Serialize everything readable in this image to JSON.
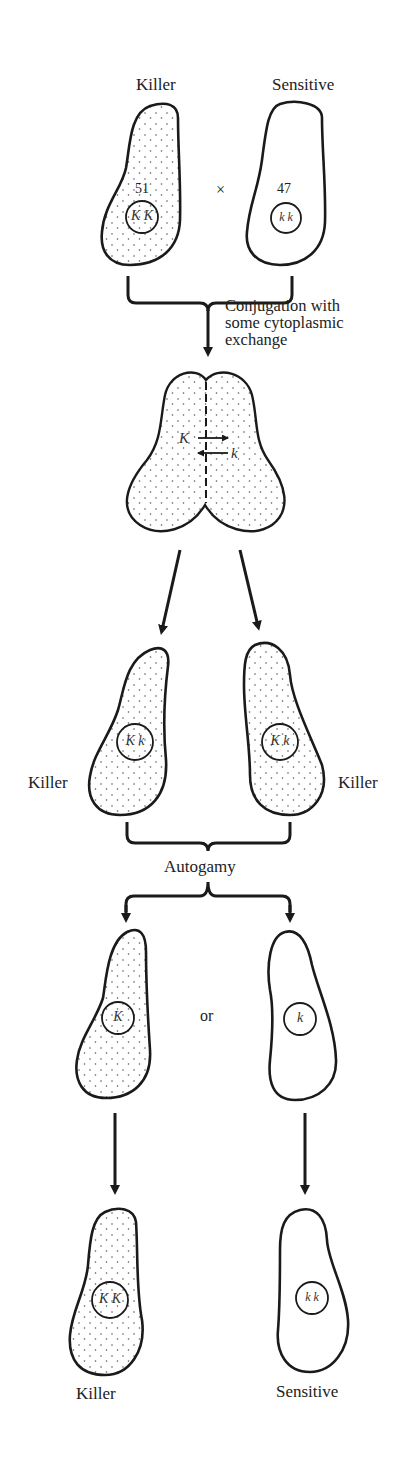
{
  "figure": {
    "stage1": {
      "left_cell": {
        "label": "Killer",
        "number": "51",
        "genotype": "K K",
        "cytoplasm": "stippled"
      },
      "right_cell": {
        "label": "Sensitive",
        "number": "47",
        "genotype": "k k",
        "cytoplasm": "clear"
      },
      "cross_symbol": "×"
    },
    "step1": {
      "label_lines": [
        "Conjugation with",
        "some cytoplasmic",
        "exchange"
      ]
    },
    "stage2": {
      "left_allele": "K",
      "right_allele": "k",
      "description": "conjugating pair with exchange arrows"
    },
    "stage3": {
      "left_cell": {
        "label": "Killer",
        "genotype": "K k"
      },
      "right_cell": {
        "label": "Killer",
        "genotype": "K k"
      }
    },
    "step2": {
      "label": "Autogamy"
    },
    "stage4": {
      "left_cell": {
        "genotype": "K",
        "cytoplasm": "stippled"
      },
      "separator": "or",
      "right_cell": {
        "genotype": "k",
        "cytoplasm": "clear"
      }
    },
    "stage5": {
      "left_cell": {
        "label": "Killer",
        "genotype": "K K",
        "cytoplasm": "stippled"
      },
      "right_cell": {
        "label": "Sensitive",
        "genotype": "k k",
        "cytoplasm": "clear"
      }
    }
  }
}
